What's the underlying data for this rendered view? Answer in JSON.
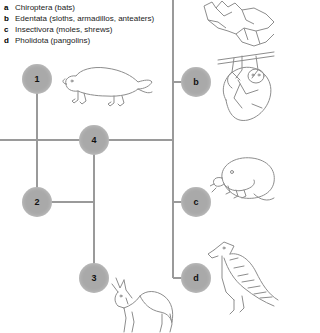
{
  "figure": {
    "type": "cladogram",
    "title": "",
    "legend": [
      {
        "key": "a",
        "label": "Chiroptera (bats)"
      },
      {
        "key": "b",
        "label": "Edentata (sloths, armadillos, anteaters)"
      },
      {
        "key": "c",
        "label": "Insectivora (moles, shrews)"
      },
      {
        "key": "d",
        "label": "Pholidota (pangolins)"
      }
    ],
    "nodes": [
      {
        "id": "1",
        "label": "1",
        "x": 37,
        "y": 79,
        "r": 15,
        "kind": "numbered-node"
      },
      {
        "id": "2",
        "label": "2",
        "x": 37,
        "y": 202,
        "r": 15,
        "kind": "numbered-node"
      },
      {
        "id": "3",
        "label": "3",
        "x": 94,
        "y": 278,
        "r": 15,
        "kind": "numbered-node"
      },
      {
        "id": "4",
        "label": "4",
        "x": 94,
        "y": 140,
        "r": 15,
        "kind": "numbered-node"
      },
      {
        "id": "b",
        "label": "b",
        "x": 196,
        "y": 82,
        "r": 15,
        "kind": "lettered-node"
      },
      {
        "id": "c",
        "label": "c",
        "x": 196,
        "y": 202,
        "r": 15,
        "kind": "lettered-node"
      },
      {
        "id": "d",
        "label": "d",
        "x": 196,
        "y": 278,
        "r": 15,
        "kind": "lettered-node"
      }
    ],
    "illustrations": [
      {
        "id": "a",
        "name": "bat",
        "x": 206,
        "y": 0
      },
      {
        "id": "1",
        "name": "platypus",
        "x": 62,
        "y": 62
      },
      {
        "id": "b",
        "name": "sloth",
        "x": 214,
        "y": 52
      },
      {
        "id": "c",
        "name": "mole",
        "x": 212,
        "y": 152
      },
      {
        "id": "3",
        "name": "deer",
        "x": 104,
        "y": 276
      },
      {
        "id": "d",
        "name": "pangolin",
        "x": 206,
        "y": 238
      }
    ],
    "colors": {
      "node_fill": "#a9a9a9",
      "node_text": "#111111",
      "branch": "#9a9a9a",
      "art_stroke": "#8a8a8a",
      "text": "#1a1a1a",
      "background": "#ffffff"
    }
  }
}
